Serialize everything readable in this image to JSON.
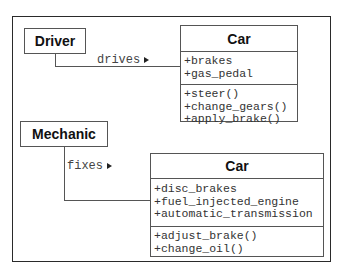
{
  "diagram": {
    "type": "UML class diagram",
    "top": {
      "actor": "Driver",
      "association": {
        "label": "drives",
        "direction_icon": "triangle-right"
      },
      "class": {
        "name": "Car",
        "attributes": [
          "+brakes",
          "+gas_pedal"
        ],
        "operations": [
          "+steer()",
          "+change_gears()",
          "+apply_brake()"
        ]
      }
    },
    "bottom": {
      "actor": "Mechanic",
      "association": {
        "label": "fixes",
        "direction_icon": "triangle-right"
      },
      "class": {
        "name": "Car",
        "attributes": [
          "+disc_brakes",
          "+fuel_injected_engine",
          "+automatic_transmission"
        ],
        "operations": [
          "+adjust_brake()",
          "+change_oil()"
        ]
      }
    }
  }
}
